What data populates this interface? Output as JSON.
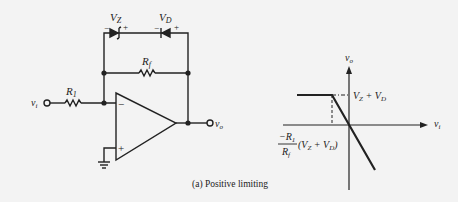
{
  "circuit": {
    "zener_label": "V",
    "zener_sub": "Z",
    "diode_label": "V",
    "diode_sub": "D",
    "rf_label": "R",
    "rf_sub": "f",
    "r1_label": "R",
    "r1_sub": "1",
    "input_label": "v",
    "input_sub": "i",
    "output_label": "v",
    "output_sub": "o",
    "minus": "−",
    "plus": "+"
  },
  "graph": {
    "y_axis_label": "v",
    "y_axis_sub": "o",
    "x_axis_label": "v",
    "x_axis_sub": "i",
    "level_label": "V",
    "level_sub1": "Z",
    "level_plus": " + V",
    "level_sub2": "D",
    "break_num": "−R",
    "break_num_sub": "1",
    "break_den": "R",
    "break_den_sub": "f",
    "break_tail": "(V",
    "break_tail_sub1": "Z",
    "break_tail_mid": " + V",
    "break_tail_sub2": "D",
    "break_close": ")"
  },
  "caption": "(a) Positive limiting"
}
